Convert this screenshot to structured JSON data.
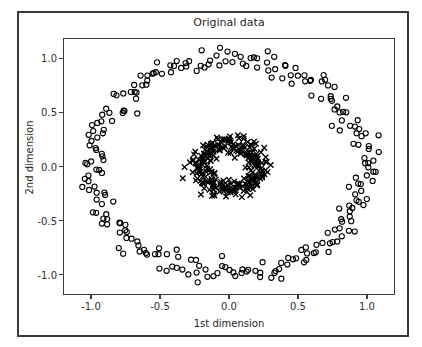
{
  "figure": {
    "title": "Original data",
    "xlabel": "1st dimension",
    "ylabel": "2nd dimension",
    "background_color": "#ffffff",
    "frame_color": "#3a3a3a"
  },
  "chart_data": {
    "type": "scatter",
    "title": "Original data",
    "xlabel": "1st dimension",
    "ylabel": "2nd dimension",
    "xlim": [
      -1.203,
      1.203
    ],
    "ylim": [
      -1.188,
      1.188
    ],
    "xticks": [
      -1.0,
      -0.5,
      0.0,
      0.5,
      1.0
    ],
    "xticklabels": [
      "-1.0",
      "-0.5",
      "0.0",
      "0.5",
      "1.0"
    ],
    "yticks": [
      -1.0,
      -0.5,
      0.0,
      0.5,
      1.0
    ],
    "yticklabels": [
      "-1.0",
      "-0.5",
      "0.0",
      "0.5",
      "1.0"
    ],
    "grid": false,
    "legend": null,
    "series": [
      {
        "name": "outer-circle",
        "marker": "o",
        "filled": false,
        "edge_color": "#000000",
        "face_color": "none",
        "marker_size": 5.2,
        "radius_mean": 1.0,
        "radius_noise": 0.055,
        "center": [
          0.0,
          0.0
        ],
        "n_points": 250,
        "points": [
          [
            1.002,
            0.055
          ],
          [
            0.986,
            0.152
          ],
          [
            1.038,
            0.232
          ],
          [
            0.975,
            0.311
          ],
          [
            0.962,
            0.386
          ],
          [
            0.918,
            0.455
          ],
          [
            0.886,
            0.517
          ],
          [
            0.848,
            0.571
          ],
          [
            0.803,
            0.617
          ],
          [
            0.757,
            0.665
          ],
          [
            0.712,
            0.707
          ],
          [
            0.658,
            0.752
          ],
          [
            0.601,
            0.795
          ],
          [
            0.547,
            0.831
          ],
          [
            0.487,
            0.866
          ],
          [
            0.425,
            0.895
          ],
          [
            0.361,
            0.924
          ],
          [
            0.296,
            0.948
          ],
          [
            0.232,
            0.973
          ],
          [
            0.166,
            0.989
          ],
          [
            0.099,
            1.002
          ],
          [
            0.033,
            1.008
          ],
          [
            -0.034,
            1.012
          ],
          [
            -0.101,
            1.004
          ],
          [
            -0.167,
            0.995
          ],
          [
            -0.233,
            0.977
          ],
          [
            -0.298,
            0.954
          ],
          [
            -0.361,
            0.928
          ],
          [
            -0.424,
            0.893
          ],
          [
            -0.486,
            0.858
          ],
          [
            -0.544,
            0.824
          ],
          [
            -0.601,
            0.788
          ],
          [
            -0.655,
            0.748
          ],
          [
            -0.709,
            0.707
          ],
          [
            -0.758,
            0.661
          ],
          [
            -0.804,
            0.614
          ],
          [
            -0.846,
            0.566
          ],
          [
            -0.884,
            0.514
          ],
          [
            -0.918,
            0.459
          ],
          [
            -0.946,
            0.401
          ],
          [
            -0.969,
            0.341
          ],
          [
            -0.987,
            0.279
          ],
          [
            -0.999,
            0.216
          ],
          [
            -1.006,
            0.153
          ],
          [
            -1.008,
            0.089
          ],
          [
            -1.004,
            0.025
          ],
          [
            -0.997,
            -0.039
          ],
          [
            -0.984,
            -0.103
          ],
          [
            -0.965,
            -0.166
          ],
          [
            -0.942,
            -0.228
          ],
          [
            -0.913,
            -0.288
          ],
          [
            -0.88,
            -0.345
          ],
          [
            -0.843,
            -0.401
          ],
          [
            -0.802,
            -0.454
          ],
          [
            -0.757,
            -0.504
          ],
          [
            -0.708,
            -0.551
          ],
          [
            -0.657,
            -0.594
          ],
          [
            -0.602,
            -0.635
          ],
          [
            -0.545,
            -0.671
          ],
          [
            -0.486,
            -0.704
          ],
          [
            -0.425,
            -0.733
          ],
          [
            -0.362,
            -0.759
          ],
          [
            -0.297,
            -0.781
          ],
          [
            -0.232,
            -0.799
          ],
          [
            -0.166,
            -0.812
          ],
          [
            -0.1,
            -0.822
          ],
          [
            -0.033,
            -0.828
          ],
          [
            0.034,
            -0.83
          ],
          [
            0.101,
            -0.827
          ],
          [
            0.167,
            -0.82
          ],
          [
            0.233,
            -0.81
          ],
          [
            0.298,
            -0.795
          ],
          [
            0.362,
            -0.777
          ],
          [
            0.425,
            -0.755
          ],
          [
            0.487,
            -0.729
          ],
          [
            0.546,
            -0.7
          ],
          [
            0.604,
            -0.668
          ],
          [
            0.659,
            -0.633
          ],
          [
            0.711,
            -0.595
          ],
          [
            0.76,
            -0.554
          ],
          [
            0.806,
            -0.511
          ],
          [
            0.848,
            -0.465
          ],
          [
            0.886,
            -0.418
          ],
          [
            0.92,
            -0.368
          ],
          [
            0.949,
            -0.317
          ],
          [
            0.974,
            -0.264
          ],
          [
            0.993,
            -0.21
          ],
          [
            1.007,
            -0.156
          ],
          [
            1.016,
            -0.1
          ],
          [
            1.02,
            -0.045
          ]
        ],
        "note": "250 points uniformly distributed on a circle of radius ~1.0 with gaussian noise sigma~0.055; rendered procedurally"
      },
      {
        "name": "inner-circle",
        "marker": "x",
        "filled": true,
        "edge_color": "#000000",
        "face_color": "#000000",
        "marker_size": 5.5,
        "radius_mean": 0.215,
        "radius_noise": 0.045,
        "center": [
          0.0,
          0.0
        ],
        "n_points": 250,
        "note": "250 points uniformly distributed on a circle of radius ~0.215 with gaussian noise sigma~0.045; rendered procedurally"
      }
    ]
  }
}
